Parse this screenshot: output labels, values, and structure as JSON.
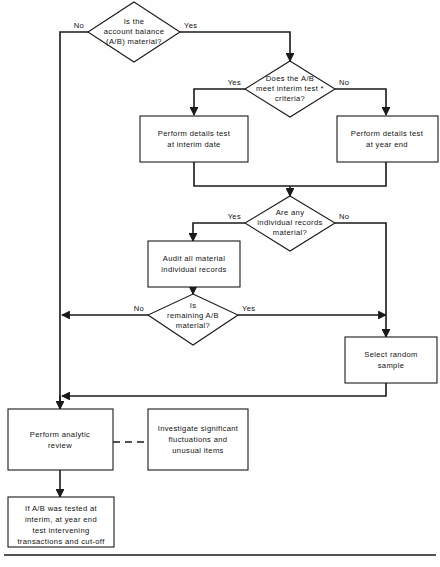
{
  "diagram": {
    "type": "flowchart",
    "colors": {
      "background": "#fefefe",
      "stroke": "#1a1a1a",
      "shape_fill": "#ffffff",
      "text": "#111111"
    },
    "nodes": [
      {
        "id": "d1",
        "shape": "diamond",
        "lines": [
          "Is the",
          "account balance",
          "(A/B) material?"
        ]
      },
      {
        "id": "d2",
        "shape": "diamond",
        "lines": [
          "Does the A/B",
          "meet interim test *",
          "criteria?"
        ]
      },
      {
        "id": "p1",
        "shape": "process",
        "lines": [
          "Perform details test",
          "at interim date"
        ]
      },
      {
        "id": "p2",
        "shape": "process",
        "lines": [
          "Perform details test",
          "at year end"
        ]
      },
      {
        "id": "d3",
        "shape": "diamond",
        "lines": [
          "Are any",
          "individual records",
          "material?"
        ]
      },
      {
        "id": "p3",
        "shape": "process",
        "lines": [
          "Audit all material",
          "individual records"
        ]
      },
      {
        "id": "d4",
        "shape": "diamond",
        "lines": [
          "Is",
          "remaining A/B",
          "material?"
        ]
      },
      {
        "id": "p4",
        "shape": "process",
        "lines": [
          "Select random",
          "sample"
        ]
      },
      {
        "id": "p5",
        "shape": "process",
        "lines": [
          "Perform analytic",
          "review"
        ]
      },
      {
        "id": "p6",
        "shape": "process",
        "lines": [
          "Investigate significant",
          "fluctuations and",
          "unusual items"
        ]
      },
      {
        "id": "p7",
        "shape": "process",
        "lines": [
          "If A/B was tested at",
          "interim, at year end",
          "test intervening",
          "transactions and cut-off"
        ]
      }
    ],
    "edge_labels": {
      "d1_no": "No",
      "d1_yes": "Yes",
      "d2_yes": "Yes",
      "d2_no": "No",
      "d3_yes": "Yes",
      "d3_no": "No",
      "d4_no": "No",
      "d4_yes": "Yes"
    }
  }
}
